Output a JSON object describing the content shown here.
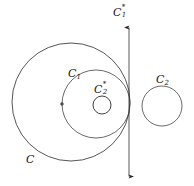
{
  "diagram": {
    "background_color": "#ffffff",
    "stroke_color": "#262626",
    "labels": {
      "outer_circle": {
        "base": "C",
        "sub": "",
        "sup": ""
      },
      "middle_circle": {
        "base": "C",
        "sub": "1",
        "sup": ""
      },
      "small_circle": {
        "base": "C",
        "sub": "2",
        "sup": "*"
      },
      "right_circle": {
        "base": "C",
        "sub": "2",
        "sup": ""
      },
      "vertical_line": {
        "base": "C",
        "sub": "1",
        "sup": "*"
      }
    },
    "shapes": [
      {
        "name": "outer-circle",
        "kind": "circle",
        "label": "C",
        "cx": 71,
        "cy": 102,
        "r": 59
      },
      {
        "name": "middle-circle",
        "kind": "circle",
        "label": "C_1",
        "cx": 96,
        "cy": 104,
        "r": 34
      },
      {
        "name": "small-circle",
        "kind": "circle",
        "label": "C_2*",
        "cx": 102,
        "cy": 105,
        "r": 9
      },
      {
        "name": "right-circle",
        "kind": "circle",
        "label": "C_2",
        "cx": 162,
        "cy": 106,
        "r": 20
      },
      {
        "name": "vertical-line",
        "kind": "line-double-arrow",
        "label": "C_1*",
        "x": 129,
        "y_top": 27,
        "y_bottom": 177
      },
      {
        "name": "center-point",
        "kind": "point",
        "cx": 62,
        "cy": 104,
        "r": 1.4
      }
    ]
  }
}
